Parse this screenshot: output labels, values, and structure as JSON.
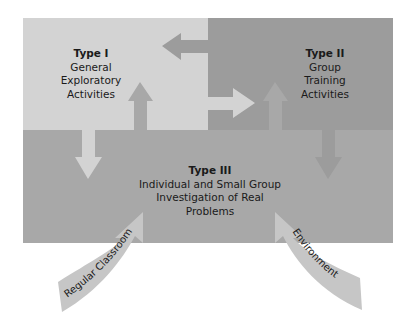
{
  "colors": {
    "type1": "#d3d3d3",
    "type2": "#9c9c9c",
    "type3": "#a8a8a8",
    "curved_arrows": "#c6c6c6",
    "text": "#1a1a1a",
    "background": "#ffffff"
  },
  "type1": {
    "title": "Type I",
    "lines": [
      "General",
      "Exploratory",
      "Activities"
    ]
  },
  "type2": {
    "title": "Type II",
    "lines": [
      "Group",
      "Training",
      "Activities"
    ]
  },
  "type3": {
    "title": "Type III",
    "lines": [
      "Individual and Small Group",
      "Investigation of Real",
      "Problems"
    ]
  },
  "inputs": {
    "left": "Regular Classroom",
    "right": "Environment"
  },
  "arrows": [
    {
      "from": "Type II",
      "to": "Type I",
      "direction": "left"
    },
    {
      "from": "Type I",
      "to": "Type II",
      "direction": "right"
    },
    {
      "from": "Type I",
      "to": "Type III",
      "direction": "down"
    },
    {
      "from": "Type III",
      "to": "Type I",
      "direction": "up"
    },
    {
      "from": "Type II",
      "to": "Type III",
      "direction": "down"
    },
    {
      "from": "Type III",
      "to": "Type II",
      "direction": "up"
    },
    {
      "from": "Regular Classroom",
      "to": "Type III",
      "direction": "up-right"
    },
    {
      "from": "Environment",
      "to": "Type III",
      "direction": "up-left"
    }
  ]
}
